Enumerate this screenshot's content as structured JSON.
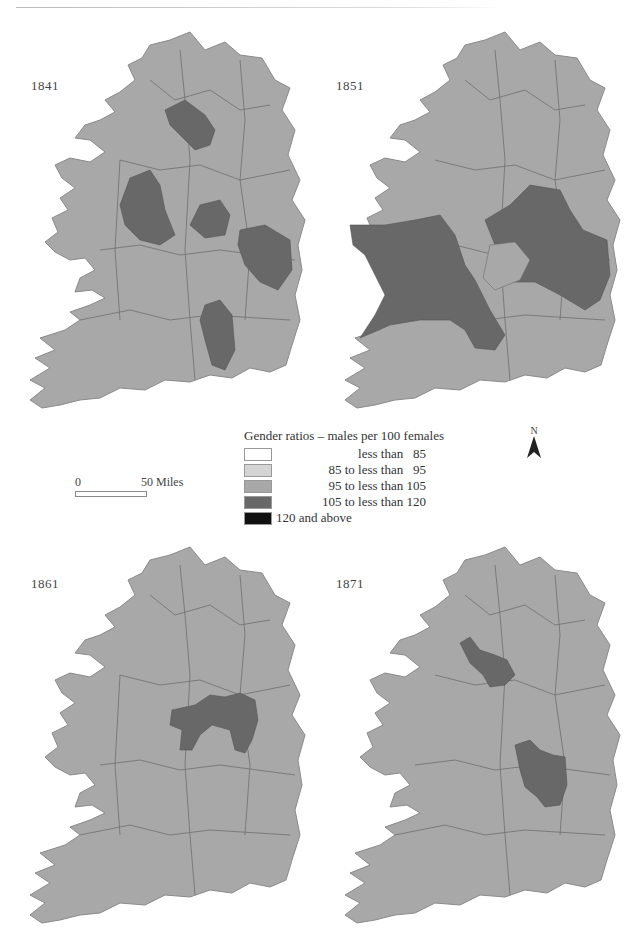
{
  "legend": {
    "title": "Gender ratios – males per 100 females",
    "classes": [
      {
        "label": "less than   85",
        "color": "#ffffff",
        "align": "right"
      },
      {
        "label": "85 to less than   95",
        "color": "#d4d4d4",
        "align": "right"
      },
      {
        "label": "95 to less than 105",
        "color": "#a8a8a8",
        "align": "right"
      },
      {
        "label": "105 to less than 120",
        "color": "#686868",
        "align": "right"
      },
      {
        "label": "120 and above",
        "color": "#111111",
        "align": "left"
      }
    ]
  },
  "scale_bar": {
    "zero": "0",
    "max": "50 Miles"
  },
  "north_arrow": {
    "label": "N"
  },
  "maps": [
    {
      "year": "1841",
      "base_class": "95 to less than 105",
      "highlighted_regions": [
        "north-central (Fermanagh/Cavan area)",
        "west-central (Roscommon area)",
        "midlands (Westmeath area)",
        "east (Dublin/Kildare area)",
        "south-central (Kilkenny area)"
      ],
      "highlight_class": "105 to less than 120"
    },
    {
      "year": "1851",
      "base_class": "95 to less than 105",
      "highlighted_regions": [
        "west (Mayo/Galway)",
        "midlands (Roscommon, Longford, Westmeath, Meath)",
        "east (Kildare/Dublin)",
        "south-central (Tipperary)"
      ],
      "highlight_class": "105 to less than 120"
    },
    {
      "year": "1861",
      "base_class": "95 to less than 105",
      "highlighted_regions": [
        "midlands (King's/Queen's County)"
      ],
      "highlight_class": "105 to less than 120"
    },
    {
      "year": "1871",
      "base_class": "95 to less than 105",
      "highlighted_regions": [
        "north-east midlands (Cavan/Monaghan)",
        "east (Kildare/Wicklow)"
      ],
      "highlight_class": "105 to less than 120"
    }
  ],
  "colors": {
    "base": "#a8a8a8",
    "dark": "#686868",
    "border": "#6e6e6e"
  }
}
